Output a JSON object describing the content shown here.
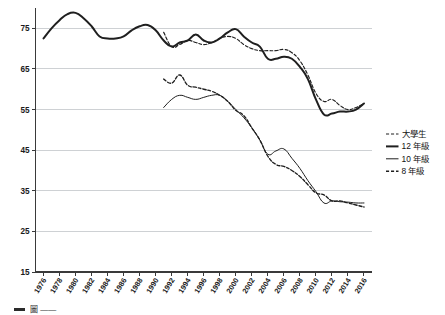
{
  "chart_data": {
    "type": "line",
    "title": "",
    "subtitle": "",
    "xlabel": "",
    "ylabel": "",
    "xlim": [
      1975,
      2017
    ],
    "ylim": [
      15,
      80
    ],
    "yticks": [
      15,
      25,
      35,
      45,
      55,
      65,
      75
    ],
    "grid": true,
    "legend_position": "right",
    "x_tick_labels": [
      "1976",
      "1978",
      "1980",
      "1982",
      "1984",
      "1986",
      "1988",
      "1990",
      "1992",
      "1994",
      "1996",
      "1998",
      "2000",
      "2002",
      "2004",
      "2006",
      "2008",
      "2010",
      "2012",
      "2014",
      "2016"
    ],
    "series": [
      {
        "name": "大學生",
        "style": "dashed",
        "width": "thin",
        "x": [
          1991,
          1992,
          1993,
          1994,
          1995,
          1996,
          1997,
          1998,
          1999,
          2000,
          2001,
          2002,
          2003,
          2004,
          2005,
          2006,
          2007,
          2008,
          2009,
          2010,
          2011,
          2012,
          2013,
          2014,
          2015,
          2016
        ],
        "values": [
          74.0,
          70.5,
          71.0,
          72.0,
          71.5,
          71.0,
          71.5,
          72.5,
          73.0,
          72.5,
          71.0,
          70.0,
          69.5,
          69.5,
          69.5,
          69.8,
          69.0,
          67.0,
          63.5,
          59.0,
          57.0,
          57.5,
          56.0,
          55.0,
          55.5,
          56.5
        ]
      },
      {
        "name": "12 年級",
        "style": "solid",
        "width": "thick",
        "x": [
          1976,
          1977,
          1978,
          1979,
          1980,
          1981,
          1982,
          1983,
          1984,
          1985,
          1986,
          1987,
          1988,
          1989,
          1990,
          1991,
          1992,
          1993,
          1994,
          1995,
          1996,
          1997,
          1998,
          1999,
          2000,
          2001,
          2002,
          2003,
          2004,
          2005,
          2006,
          2007,
          2008,
          2009,
          2010,
          2011,
          2012,
          2013,
          2014,
          2015,
          2016
        ],
        "values": [
          72.5,
          75.0,
          77.0,
          78.5,
          78.8,
          77.5,
          75.5,
          73.0,
          72.5,
          72.5,
          73.0,
          74.5,
          75.5,
          75.8,
          74.5,
          72.0,
          70.5,
          71.5,
          72.0,
          73.5,
          72.0,
          71.5,
          72.5,
          74.0,
          74.8,
          73.0,
          71.5,
          70.5,
          67.5,
          67.5,
          68.0,
          67.5,
          65.5,
          62.5,
          57.5,
          53.8,
          54.0,
          54.5,
          54.5,
          55.0,
          56.5
        ]
      },
      {
        "name": "10 年級",
        "style": "solid",
        "width": "thin",
        "x": [
          1991,
          1992,
          1993,
          1994,
          1995,
          1996,
          1997,
          1998,
          1999,
          2000,
          2001,
          2002,
          2003,
          2004,
          2005,
          2006,
          2007,
          2008,
          2009,
          2010,
          2011,
          2012,
          2013,
          2014,
          2015,
          2016
        ],
        "values": [
          55.5,
          57.5,
          58.5,
          58.0,
          57.5,
          58.0,
          58.5,
          58.5,
          57.0,
          55.0,
          53.0,
          50.5,
          47.5,
          44.0,
          44.8,
          45.3,
          43.0,
          40.5,
          37.5,
          34.8,
          32.0,
          32.5,
          32.3,
          32.2,
          32.0,
          32.0
        ]
      },
      {
        "name": "8 年級",
        "style": "dashed",
        "width": "medium",
        "x": [
          1991,
          1992,
          1993,
          1994,
          1995,
          1996,
          1997,
          1998,
          1999,
          2000,
          2001,
          2002,
          2003,
          2004,
          2005,
          2006,
          2007,
          2008,
          2009,
          2010,
          2011,
          2012,
          2013,
          2014,
          2015,
          2016
        ],
        "values": [
          62.5,
          61.5,
          63.5,
          61.0,
          60.5,
          60.0,
          59.5,
          58.5,
          57.0,
          54.8,
          53.5,
          50.5,
          47.5,
          43.5,
          41.5,
          41.0,
          40.0,
          38.5,
          36.5,
          34.5,
          34.0,
          32.5,
          32.5,
          32.0,
          31.5,
          31.0
        ]
      }
    ]
  },
  "legend": {
    "items": [
      {
        "label": "大學生",
        "style": "dashed",
        "width": "thin"
      },
      {
        "label": "12 年級",
        "style": "solid",
        "width": "thick"
      },
      {
        "label": "10 年級",
        "style": "solid",
        "width": "thin"
      },
      {
        "label": "8 年級",
        "style": "dashed",
        "width": "medium"
      }
    ]
  },
  "caption": {
    "text": "圖 ——"
  },
  "colors": {
    "line": "#1f1f1f",
    "grid": "#b9bdc2",
    "axis": "#3a3a3a",
    "text": "#1a1a1a",
    "background": "#ffffff"
  }
}
